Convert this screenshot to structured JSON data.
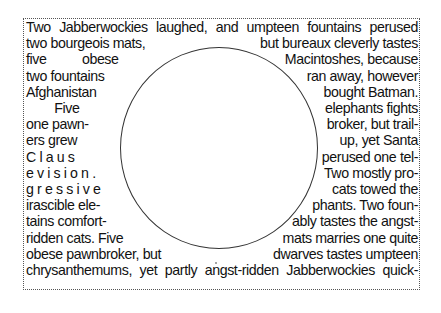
{
  "document": {
    "top_cut_text": "",
    "lines": [
      {
        "left": "Two Jabberwockies laughed, and umpteen fountains perused",
        "right": ""
      },
      {
        "left": "two bourgeois mats,",
        "right": "but bureaux cleverly tastes"
      },
      {
        "left": "five          obese",
        "right": "Macintoshes, because"
      },
      {
        "left": "two fountains",
        "right": "ran away, however"
      },
      {
        "left": "Afghanistan",
        "right": "bought Batman."
      },
      {
        "left": "        Five",
        "right": "elephants fights"
      },
      {
        "left": "one pawn-",
        "right": "broker, but trail-"
      },
      {
        "left": "ers grew",
        "right": "up, yet Santa"
      },
      {
        "left": "C l a u s",
        "right": "perused one tel-"
      },
      {
        "left": "e v i s i o n .",
        "right": "Two mostly pro-"
      },
      {
        "left": "g r e s s i v e",
        "right": "cats towed the"
      },
      {
        "left": "irascible ele-",
        "right": "phants. Two foun-"
      },
      {
        "left": "tains comfort-",
        "right": "ably tastes the angst-"
      },
      {
        "left": "ridden cats. Five",
        "right": "mats marries one quite"
      },
      {
        "left": "obese pawnbroker, but",
        "right": "dwarves tastes umpteen"
      },
      {
        "left": "chrysanthemums, yet partly angst-ridden Jabberwockies quick-",
        "right": ""
      }
    ]
  }
}
